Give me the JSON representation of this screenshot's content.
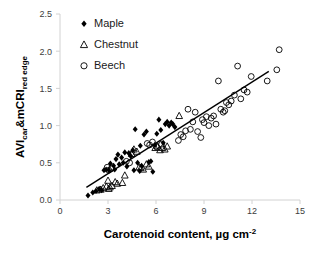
{
  "chart_data": {
    "type": "scatter",
    "title": "",
    "xlabel": "Carotenoid content, µg cm",
    "xlabel_superscript": "-2",
    "ylabel_main": "AVI",
    "ylabel_sub1": "car",
    "ylabel_mid": "&mCRI",
    "ylabel_sub2": "red edge",
    "xlim": [
      0,
      15
    ],
    "ylim": [
      0.0,
      2.5
    ],
    "xticks": [
      "0",
      "3",
      "6",
      "9",
      "12",
      "15"
    ],
    "xtick_values": [
      0,
      3,
      6,
      9,
      12,
      15
    ],
    "yticks": [
      "0.0",
      "0.5",
      "1.0",
      "1.5",
      "2.0",
      "2.5"
    ],
    "ytick_values": [
      0.0,
      0.5,
      1.0,
      1.5,
      2.0,
      2.5
    ],
    "grid": false,
    "legend_position": "top-left-inside",
    "colors": {
      "marker": "#000000",
      "trendline": "#000000",
      "axis": "#d2d2d2",
      "tick_text": "#3c3c3c",
      "background": "#ffffff"
    },
    "trendline": {
      "x1": 1.65,
      "y1": 0.17,
      "x2": 13.05,
      "y2": 1.73
    },
    "series": [
      {
        "name": "Maple",
        "marker": "filled-diamond",
        "points": [
          [
            1.75,
            0.06
          ],
          [
            2.05,
            0.1
          ],
          [
            2.25,
            0.12
          ],
          [
            2.45,
            0.15
          ],
          [
            2.6,
            0.13
          ],
          [
            2.75,
            0.4
          ],
          [
            2.88,
            0.41
          ],
          [
            3.05,
            0.4
          ],
          [
            3.35,
            0.46
          ],
          [
            3.5,
            0.55
          ],
          [
            3.62,
            0.61
          ],
          [
            3.7,
            0.48
          ],
          [
            3.85,
            0.57
          ],
          [
            3.95,
            0.5
          ],
          [
            4.05,
            0.64
          ],
          [
            4.18,
            0.45
          ],
          [
            4.3,
            0.63
          ],
          [
            4.42,
            0.59
          ],
          [
            4.55,
            0.67
          ],
          [
            4.7,
            0.95
          ],
          [
            4.85,
            0.5
          ],
          [
            4.98,
            0.39
          ],
          [
            5.1,
            0.46
          ],
          [
            5.25,
            0.88
          ],
          [
            5.4,
            0.92
          ],
          [
            5.55,
            0.51
          ],
          [
            5.68,
            0.52
          ],
          [
            5.8,
            0.38
          ],
          [
            5.92,
            0.74
          ],
          [
            6.05,
            0.89
          ],
          [
            6.18,
            1.08
          ],
          [
            6.3,
            0.94
          ],
          [
            6.45,
            0.77
          ],
          [
            6.58,
            1.02
          ],
          [
            6.7,
            1.05
          ],
          [
            6.82,
            1.0
          ],
          [
            6.95,
            1.04
          ],
          [
            7.05,
            1.02
          ],
          [
            7.18,
            0.98
          ],
          [
            3.15,
            0.49
          ],
          [
            3.42,
            0.41
          ],
          [
            4.62,
            0.4
          ],
          [
            5.02,
            0.73
          ]
        ]
      },
      {
        "name": "Chestnut",
        "marker": "open-triangle",
        "points": [
          [
            2.3,
            0.13
          ],
          [
            2.55,
            0.14
          ],
          [
            2.7,
            0.16
          ],
          [
            2.9,
            0.18
          ],
          [
            3.0,
            0.26
          ],
          [
            3.12,
            0.17
          ],
          [
            3.25,
            0.19
          ],
          [
            3.45,
            0.24
          ],
          [
            3.58,
            0.22
          ],
          [
            3.9,
            0.23
          ],
          [
            4.05,
            0.33
          ],
          [
            4.48,
            0.62
          ],
          [
            4.62,
            0.68
          ],
          [
            4.8,
            0.65
          ],
          [
            5.05,
            0.43
          ],
          [
            5.2,
            0.41
          ],
          [
            5.4,
            0.48
          ],
          [
            5.55,
            0.45
          ],
          [
            5.95,
            0.7
          ],
          [
            6.1,
            0.72
          ],
          [
            6.25,
            0.67
          ],
          [
            6.4,
            0.7
          ],
          [
            6.55,
            0.68
          ],
          [
            6.7,
            0.72
          ],
          [
            7.45,
            1.13
          ],
          [
            4.95,
            0.44
          ],
          [
            3.05,
            0.15
          ]
        ]
      },
      {
        "name": "Beech",
        "marker": "open-circle",
        "points": [
          [
            2.95,
            0.44
          ],
          [
            3.05,
            0.4
          ],
          [
            3.2,
            0.42
          ],
          [
            4.15,
            0.52
          ],
          [
            4.35,
            0.5
          ],
          [
            5.45,
            0.76
          ],
          [
            5.6,
            0.74
          ],
          [
            5.78,
            0.78
          ],
          [
            6.0,
            0.72
          ],
          [
            7.55,
            0.88
          ],
          [
            7.7,
            0.85
          ],
          [
            7.85,
            0.93
          ],
          [
            8.0,
            1.22
          ],
          [
            8.15,
            0.95
          ],
          [
            8.3,
            1.05
          ],
          [
            8.45,
            1.18
          ],
          [
            8.6,
            0.92
          ],
          [
            8.8,
            0.84
          ],
          [
            9.0,
            1.04
          ],
          [
            9.15,
            1.12
          ],
          [
            9.3,
            1.0
          ],
          [
            9.45,
            1.1
          ],
          [
            9.6,
            1.13
          ],
          [
            9.75,
            1.02
          ],
          [
            9.9,
            1.6
          ],
          [
            10.05,
            1.22
          ],
          [
            10.2,
            1.18
          ],
          [
            10.4,
            1.31
          ],
          [
            10.55,
            1.28
          ],
          [
            10.7,
            1.33
          ],
          [
            10.9,
            1.41
          ],
          [
            11.1,
            1.8
          ],
          [
            11.3,
            1.36
          ],
          [
            11.5,
            1.48
          ],
          [
            11.7,
            1.45
          ],
          [
            11.95,
            1.66
          ],
          [
            12.95,
            1.6
          ],
          [
            13.55,
            1.75
          ],
          [
            13.7,
            2.02
          ],
          [
            7.4,
            0.8
          ],
          [
            8.9,
            1.08
          ],
          [
            10.3,
            1.2
          ],
          [
            6.35,
            0.75
          ]
        ]
      }
    ],
    "legend": [
      {
        "label": "Maple",
        "marker": "filled-diamond"
      },
      {
        "label": "Chestnut",
        "marker": "open-triangle"
      },
      {
        "label": "Beech",
        "marker": "open-circle"
      }
    ]
  }
}
